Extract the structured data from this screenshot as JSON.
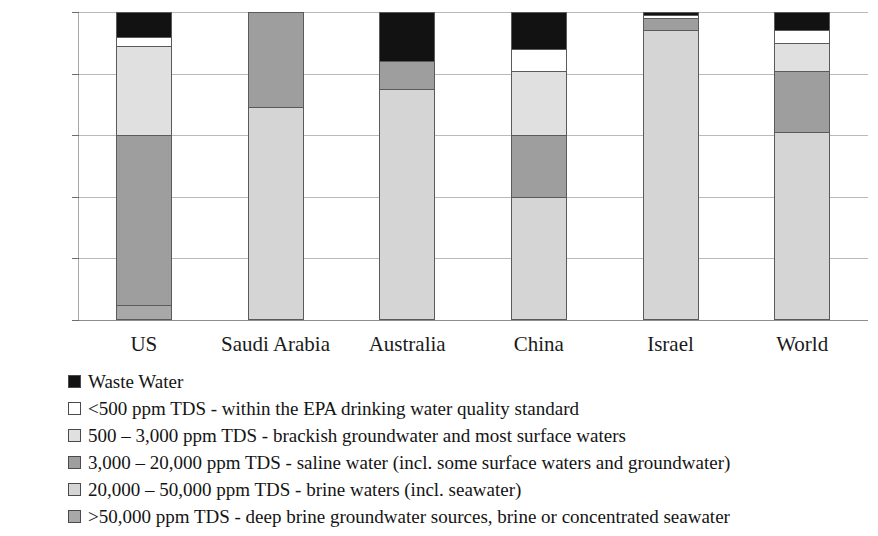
{
  "chart_data": {
    "type": "bar",
    "subtype": "stacked-percent",
    "title": "",
    "xlabel": "",
    "ylabel": "",
    "ylim": [
      0,
      100
    ],
    "ytick_labels": [
      "0%",
      "20%",
      "40%",
      "60%",
      "80%",
      "100%"
    ],
    "ytick_values": [
      0,
      20,
      40,
      60,
      80,
      100
    ],
    "grid": true,
    "legend_position": "below",
    "categories": [
      "US",
      "Saudi Arabia",
      "Australia",
      "China",
      "Israel",
      "World"
    ],
    "series": [
      {
        "name": ">50,000 ppm TDS - deep brine groundwater sources, brine or concentrated seawater",
        "color": "#a8a8a8",
        "values": [
          5,
          0,
          0,
          0,
          0,
          0
        ]
      },
      {
        "name": "20,000 - 50,000 ppm TDS - brine waters (incl. seawater)",
        "color": "#d5d5d5",
        "values": [
          0,
          69,
          75,
          40,
          94,
          61
        ]
      },
      {
        "name": "3,000 - 20,000 ppm TDS - saline water (incl. some surface waters and groundwater)",
        "color": "#9e9e9e",
        "values": [
          55,
          31,
          9,
          20,
          4,
          20
        ]
      },
      {
        "name": "500 - 3,000 ppm TDS - brackish groundwater and most surface waters",
        "color": "#e0e0e0",
        "values": [
          29,
          0,
          0,
          21,
          0,
          9
        ]
      },
      {
        "name": "<500 ppm TDS - within the EPA drinking water quality standard",
        "color": "#ffffff",
        "values": [
          3,
          0,
          0,
          7,
          1,
          4
        ]
      },
      {
        "name": "Waste Water",
        "color": "#121212",
        "values": [
          8,
          0,
          16,
          12,
          1,
          6
        ]
      }
    ]
  },
  "legend": {
    "items": [
      {
        "label": "Waste Water",
        "color": "#121212"
      },
      {
        "label": "<500 ppm TDS - within the EPA drinking water quality standard",
        "color": "#ffffff"
      },
      {
        "label": "500 – 3,000 ppm TDS - brackish groundwater and most surface waters",
        "color": "#e0e0e0"
      },
      {
        "label": "3,000 – 20,000 ppm TDS - saline water (incl. some surface waters and groundwater)",
        "color": "#9e9e9e"
      },
      {
        "label": "20,000 – 50,000 ppm TDS - brine waters (incl. seawater)",
        "color": "#d5d5d5"
      },
      {
        "label": ">50,000 ppm TDS - deep brine groundwater sources, brine or concentrated seawater",
        "color": "#a8a8a8"
      }
    ]
  }
}
